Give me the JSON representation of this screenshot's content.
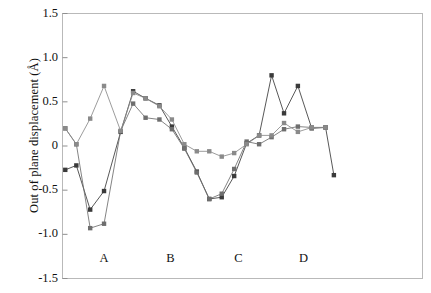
{
  "chart_data": {
    "type": "line",
    "title": "",
    "xlabel": "",
    "ylabel": "Out of plane displacement (Å)",
    "ylim": [
      -1.5,
      1.5
    ],
    "yticks": [
      1.5,
      1.0,
      0.5,
      0,
      -0.5,
      -1.0,
      -1.5
    ],
    "ytick_labels": [
      "1.5",
      "1.0",
      "0.5",
      "0",
      "-0.5",
      "-1.0",
      "-1.5"
    ],
    "xlim": [
      0,
      26
    ],
    "grid": false,
    "legend": "none",
    "group_labels": [
      "A",
      "B",
      "C",
      "D"
    ],
    "group_label_x": [
      3.0,
      7.8,
      12.7,
      17.4
    ],
    "marker": "square",
    "marker_size": 2.2,
    "series": [
      {
        "name": "series-1",
        "color": "#3a3a3a",
        "x": [
          0.2,
          1.0,
          2.0,
          3.0,
          4.2,
          5.1,
          6.0,
          7.0,
          7.9,
          8.8,
          9.7,
          10.6,
          11.5,
          12.4,
          13.3,
          14.2,
          15.1,
          16.0,
          17.0,
          18.0,
          19.0,
          19.6
        ],
        "values": [
          -0.27,
          -0.22,
          -0.72,
          -0.51,
          0.16,
          0.62,
          0.54,
          0.46,
          0.22,
          -0.02,
          -0.29,
          -0.6,
          -0.58,
          -0.34,
          0.03,
          0.12,
          0.8,
          0.37,
          0.68,
          0.2,
          0.21,
          -0.33
        ]
      },
      {
        "name": "series-2",
        "color": "#6e6e6e",
        "x": [
          0.2,
          1.0,
          2.0,
          3.0,
          4.2,
          5.1,
          6.0,
          7.0,
          7.9,
          8.8,
          9.7,
          10.6,
          11.5,
          12.4,
          13.3,
          14.2,
          15.1,
          16.0,
          17.0,
          18.0,
          19.0
        ],
        "values": [
          0.2,
          0.02,
          -0.93,
          -0.88,
          0.17,
          0.48,
          0.32,
          0.3,
          0.19,
          -0.03,
          -0.3,
          -0.6,
          -0.54,
          -0.26,
          0.05,
          0.02,
          0.1,
          0.19,
          0.22,
          0.21,
          0.21
        ]
      },
      {
        "name": "series-3",
        "color": "#8a8a8a",
        "x": [
          0.2,
          1.0,
          2.0,
          3.0,
          4.2,
          5.1,
          6.0,
          7.0,
          7.9,
          8.8,
          9.7,
          10.6,
          11.5,
          12.4,
          13.3,
          14.2,
          15.1,
          16.0,
          17.0,
          18.0,
          19.0
        ],
        "values": [
          0.2,
          0.02,
          0.31,
          0.68,
          0.17,
          0.6,
          0.54,
          0.45,
          0.3,
          0.02,
          -0.06,
          -0.06,
          -0.12,
          -0.08,
          0.02,
          0.12,
          0.12,
          0.26,
          0.16,
          0.21,
          0.21
        ]
      }
    ]
  },
  "axes": {
    "frame_color": "#b9b9b9",
    "tick_color": "#8f8f8f"
  }
}
